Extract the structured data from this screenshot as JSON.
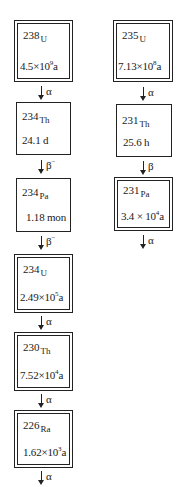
{
  "diagram": {
    "title": "",
    "chains": [
      {
        "name": "uranium-238 series",
        "nuclides": [
          {
            "mass": "238",
            "symbol": "U",
            "half_life_mantissa": "4.5×10",
            "half_life_exp": "9",
            "half_life_unit": "a",
            "border": "double"
          },
          {
            "mass": "234",
            "symbol": "Th",
            "half_life_text": "24.1 d",
            "border": "single"
          },
          {
            "mass": "234",
            "symbol": "Pa",
            "half_life_text": "1.18 mon",
            "border": "single"
          },
          {
            "mass": "234",
            "symbol": "U",
            "half_life_mantissa": "2.49×10",
            "half_life_exp": "5",
            "half_life_unit": "a",
            "border": "double"
          },
          {
            "mass": "230",
            "symbol": "Th",
            "half_life_mantissa": "7.52×10",
            "half_life_exp": "4",
            "half_life_unit": "a",
            "border": "double"
          },
          {
            "mass": "226",
            "symbol": "Ra",
            "half_life_mantissa": "1.62×10",
            "half_life_exp": "3",
            "half_life_unit": "a",
            "border": "double"
          }
        ],
        "decays": [
          {
            "label": "α",
            "sup": ""
          },
          {
            "label": "β",
            "sup": "−"
          },
          {
            "label": "β",
            "sup": "−"
          },
          {
            "label": "α",
            "sup": ""
          },
          {
            "label": "α",
            "sup": ""
          },
          {
            "label": "α",
            "sup": ""
          }
        ]
      },
      {
        "name": "uranium-235 series",
        "nuclides": [
          {
            "mass": "235",
            "symbol": "U",
            "half_life_mantissa": "7.13×10",
            "half_life_exp": "8",
            "half_life_unit": "a",
            "border": "double"
          },
          {
            "mass": "231",
            "symbol": "Th",
            "half_life_text": "25.6 h",
            "border": "single"
          },
          {
            "mass": "231",
            "symbol": "Pa",
            "half_life_mantissa": "3.4 × 10",
            "half_life_exp": "4",
            "half_life_unit": "a",
            "border": "double"
          }
        ],
        "decays": [
          {
            "label": "α",
            "sup": ""
          },
          {
            "label": "β",
            "sup": ""
          },
          {
            "label": "α",
            "sup": ""
          }
        ]
      }
    ]
  }
}
